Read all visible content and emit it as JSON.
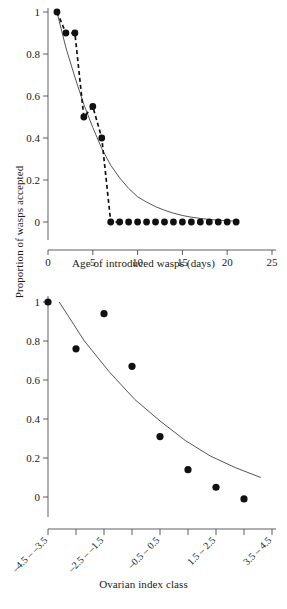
{
  "figure": {
    "shared_y_axis_label": "Proportion of wasps accepted",
    "background_color": "#ffffff",
    "marker_color": "#111111",
    "fit_curve_color": "#555555",
    "observed_curve_color": "#111111"
  },
  "chart_data": [
    {
      "type": "scatter",
      "panel": "top",
      "title": "",
      "xlabel": "Age of introduced wasps (days)",
      "ylabel": "Proportion of wasps accepted",
      "xlim": [
        0,
        25
      ],
      "ylim": [
        0,
        1
      ],
      "xticks": [
        0,
        5,
        10,
        15,
        20,
        25
      ],
      "xtick_labels": [
        "0",
        "5",
        "10",
        "15",
        "20",
        "25"
      ],
      "yticks": [
        0,
        0.2,
        0.4,
        0.6,
        0.8,
        1
      ],
      "ytick_labels": [
        "0",
        "0.2",
        "0.4",
        "0.6",
        "0.8",
        "1"
      ],
      "grid": false,
      "legend": false,
      "x": [
        1,
        2,
        3,
        4,
        5,
        6,
        7,
        8,
        9,
        10,
        11,
        12,
        13,
        14,
        15,
        16,
        17,
        18,
        19,
        20,
        21
      ],
      "y": [
        1.0,
        0.9,
        0.9,
        0.5,
        0.55,
        0.4,
        0.0,
        0.0,
        0.0,
        0.0,
        0.0,
        0.0,
        0.0,
        0.0,
        0.0,
        0.0,
        0.0,
        0.0,
        0.0,
        0.0,
        0.0
      ],
      "series": [
        {
          "name": "observed",
          "style": "dashed",
          "x": [
            1,
            2,
            3,
            4,
            5,
            6,
            7,
            8,
            9,
            10,
            11,
            12,
            13,
            14,
            15,
            16,
            17,
            18,
            19,
            20,
            21
          ],
          "values": [
            1.0,
            0.9,
            0.9,
            0.5,
            0.55,
            0.4,
            0.0,
            0.0,
            0.0,
            0.0,
            0.0,
            0.0,
            0.0,
            0.0,
            0.0,
            0.0,
            0.0,
            0.0,
            0.0,
            0.0,
            0.0
          ]
        },
        {
          "name": "fitted",
          "style": "solid",
          "x": [
            1,
            2,
            3,
            4,
            5,
            6,
            7,
            8,
            9,
            10,
            11,
            12,
            13,
            14,
            15,
            16,
            17,
            18,
            19,
            20,
            21
          ],
          "values": [
            1.0,
            0.83,
            0.69,
            0.56,
            0.45,
            0.35,
            0.27,
            0.21,
            0.16,
            0.12,
            0.095,
            0.073,
            0.056,
            0.042,
            0.031,
            0.023,
            0.017,
            0.012,
            0.009,
            0.006,
            0.004
          ]
        }
      ]
    },
    {
      "type": "scatter",
      "panel": "bottom",
      "title": "",
      "xlabel": "Ovarian index class",
      "ylabel": "Proportion of wasps accepted",
      "ylim": [
        0,
        1
      ],
      "yticks": [
        0,
        0.2,
        0.4,
        0.6,
        0.8,
        1
      ],
      "ytick_labels": [
        "0",
        "0.2",
        "0.4",
        "0.6",
        "0.8",
        "1"
      ],
      "grid": false,
      "legend": false,
      "categories": [
        "-4.5 - -3.5",
        "-2.5 - -1.5",
        "-0.5 - 0.5",
        "1.5 - 2.5",
        "3.5 - 4.5"
      ],
      "xtick_labels": [
        "–4.5 – –3.5",
        "–2.5 – –1.5",
        "–0.5 – 0.5",
        "1.5 – 2.5",
        "3.5 – 4.5"
      ],
      "x": [
        0,
        1,
        2,
        3,
        4,
        5,
        6,
        7,
        8
      ],
      "y": [
        1.0,
        0.76,
        0.94,
        0.67,
        0.31,
        0.14,
        0.05,
        -0.01
      ],
      "values": [
        1.0,
        0.76,
        0.94,
        0.67,
        0.31,
        0.14,
        0.05,
        -0.01
      ],
      "series": [
        {
          "name": "fitted",
          "style": "solid",
          "values": [
            1.0,
            0.8,
            0.64,
            0.5,
            0.39,
            0.29,
            0.21,
            0.15,
            0.1
          ]
        }
      ]
    }
  ]
}
